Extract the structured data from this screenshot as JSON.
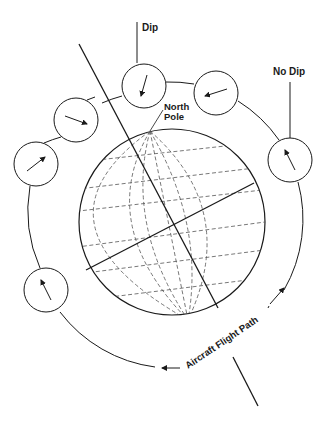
{
  "diagram": {
    "labels": {
      "dip": "Dip",
      "no_dip": "No Dip",
      "north_line1": "North",
      "north_line2": "Pole",
      "flight_path": "Aircraft Flight Path"
    },
    "colors": {
      "ink": "#1a1a1a",
      "grid": "#555555",
      "background": "#ffffff"
    },
    "compasses": [
      {
        "id": "dip",
        "cx": 144,
        "cy": 86,
        "angle_deg": 105
      },
      {
        "id": "top-right",
        "cx": 216,
        "cy": 93,
        "angle_deg": 162
      },
      {
        "id": "upper-left",
        "cx": 76,
        "cy": 120,
        "angle_deg": 20
      },
      {
        "id": "left",
        "cx": 36,
        "cy": 164,
        "angle_deg": -38
      },
      {
        "id": "no-dip",
        "cx": 290,
        "cy": 160,
        "angle_deg": -117
      },
      {
        "id": "lower-left",
        "cx": 46,
        "cy": 290,
        "angle_deg": -118
      }
    ]
  }
}
